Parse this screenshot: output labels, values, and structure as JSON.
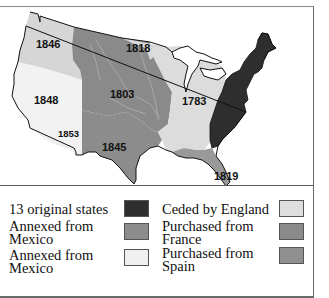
{
  "map": {
    "region_labels": {
      "oregon": "1846",
      "mexican_cession": "1848",
      "gadsden": "1853",
      "louisiana": "1803",
      "red_river": "1818",
      "texas": "1845",
      "treaty_of_paris": "1783",
      "florida": "1819"
    },
    "colors": {
      "original_states": "#2e2e2e",
      "ceded_by_england": "#dcdcdc",
      "louisiana_purchase": "#8a8a8a",
      "texas": "#8c8c8c",
      "mexican_cession": "#f2f2f2",
      "oregon": "#d6d6d6",
      "red_river": "#d8d8d8",
      "florida": "#9a9a9a",
      "lakes": "#ffffff",
      "outline": "#111111"
    }
  },
  "legend": {
    "items": [
      {
        "label": "13 original states",
        "color": "#2e2e2e"
      },
      {
        "label": "Annexed from\nMexico",
        "color": "#8c8c8c"
      },
      {
        "label": "Annexed from\nMexico",
        "color": "#f0f0f0"
      },
      {
        "label": "Ceded by England",
        "color": "#dedede"
      },
      {
        "label": "Purchased from\nFrance",
        "color": "#8a8a8a"
      },
      {
        "label": "Purchased from\nSpain",
        "color": "#909090"
      }
    ]
  }
}
